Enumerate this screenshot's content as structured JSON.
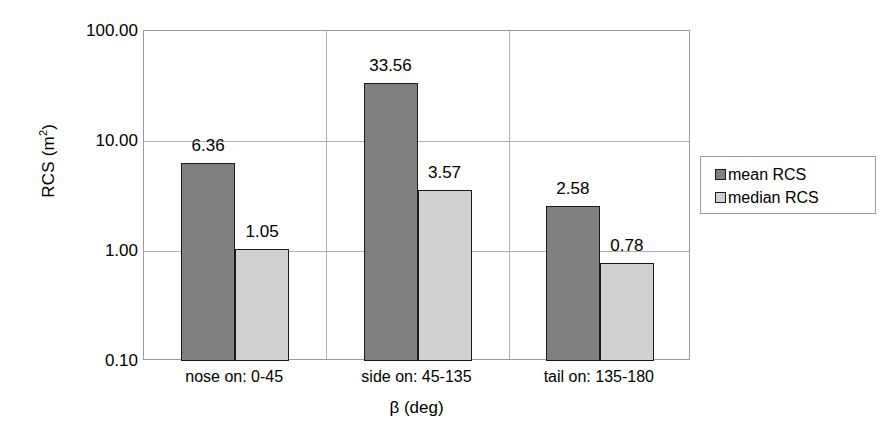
{
  "chart_data": {
    "type": "bar",
    "title": "",
    "xlabel": "β (deg)",
    "ylabel": "RCS (m²)",
    "ylabel_base": "RCS (m",
    "ylabel_sup": "2",
    "ylabel_tail": ")",
    "yscale": "log",
    "ylim": [
      0.1,
      100
    ],
    "grid": true,
    "legend_position": "right",
    "categories": [
      "nose on:  0-45",
      "side on: 45-135",
      "tail on: 135-180"
    ],
    "ytick_labels": [
      "100.00",
      "10.00",
      "1.00",
      "0.10"
    ],
    "ytick_values": [
      100,
      10,
      1,
      0.1
    ],
    "series": [
      {
        "name": "mean RCS",
        "color": "#808080",
        "values": [
          6.36,
          33.56,
          2.58
        ],
        "labels": [
          "6.36",
          "33.56",
          "2.58"
        ]
      },
      {
        "name": "median RCS",
        "color": "#d0d0d0",
        "values": [
          1.05,
          3.57,
          0.78
        ],
        "labels": [
          "1.05",
          "3.57",
          "0.78"
        ]
      }
    ]
  },
  "axes": {
    "y_title": "RCS (m",
    "y_title_sup": "2",
    "y_title_end": ")",
    "x_title": "β (deg)",
    "y_ticks": [
      {
        "label": "100.00",
        "value": 100
      },
      {
        "label": "10.00",
        "value": 10
      },
      {
        "label": "1.00",
        "value": 1
      },
      {
        "label": "0.10",
        "value": 0.1
      }
    ],
    "x_categories": [
      {
        "label": "nose on:  0-45"
      },
      {
        "label": "side on: 45-135"
      },
      {
        "label": "tail on: 135-180"
      }
    ]
  },
  "legend": {
    "entries": [
      {
        "label": "mean RCS",
        "color": "#808080"
      },
      {
        "label": "median RCS",
        "color": "#d0d0d0"
      }
    ]
  },
  "colors": {
    "mean": "#808080",
    "median": "#d0d0d0",
    "bar_outline": "#1a1a1a",
    "gridline": "#b0b0b0",
    "axis_border": "#9a9a9a",
    "background": "#ffffff",
    "text": "#000000"
  }
}
